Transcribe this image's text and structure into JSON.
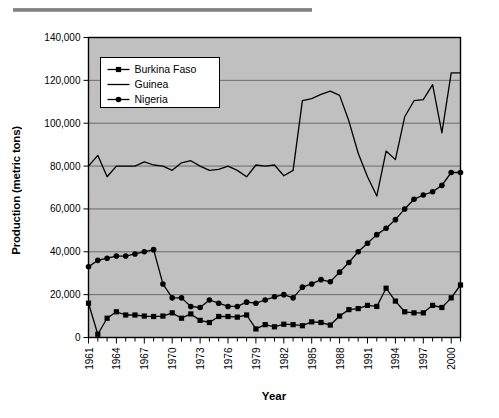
{
  "chart_data": {
    "type": "line",
    "title": "",
    "xlabel": "Year",
    "ylabel": "Production (metric tons)",
    "xlim": [
      1961,
      2001
    ],
    "ylim": [
      0,
      140000
    ],
    "ytick_values": [
      0,
      20000,
      40000,
      60000,
      80000,
      100000,
      120000,
      140000
    ],
    "ytick_labels": [
      "0",
      "20,000",
      "40,000",
      "60,000",
      "80,000",
      "100,000",
      "120,000",
      "140,000"
    ],
    "x": [
      1961,
      1962,
      1963,
      1964,
      1965,
      1966,
      1967,
      1968,
      1969,
      1970,
      1971,
      1972,
      1973,
      1974,
      1975,
      1976,
      1977,
      1978,
      1979,
      1980,
      1981,
      1982,
      1983,
      1984,
      1985,
      1986,
      1987,
      1988,
      1989,
      1990,
      1991,
      1992,
      1993,
      1994,
      1995,
      1996,
      1997,
      1998,
      1999,
      2000,
      2001
    ],
    "xtick_labels": [
      "1961",
      "1964",
      "1967",
      "1970",
      "1973",
      "1976",
      "1979",
      "1982",
      "1985",
      "1988",
      "1991",
      "1994",
      "1997",
      "2000"
    ],
    "xtick_values": [
      1961,
      1964,
      1967,
      1970,
      1973,
      1976,
      1979,
      1982,
      1985,
      1988,
      1991,
      1994,
      1997,
      2000
    ],
    "grid": "horizontal",
    "legend_position": "upper-left",
    "plot_background": "#c0c0c0",
    "series": [
      {
        "name": "Burkina Faso",
        "marker": "square",
        "color": "#000000",
        "values": [
          16000,
          1500,
          9000,
          12000,
          10500,
          10500,
          10000,
          9800,
          10000,
          11500,
          9000,
          11000,
          8000,
          7000,
          9800,
          9800,
          9500,
          10500,
          4000,
          6000,
          5000,
          6200,
          6000,
          5500,
          7300,
          7000,
          5800,
          10000,
          13000,
          13500,
          15000,
          14500,
          23000,
          17000,
          12000,
          11500,
          11500,
          15000,
          14000,
          18500,
          24500
        ]
      },
      {
        "name": "Guinea",
        "marker": "none",
        "color": "#000000",
        "values": [
          80000,
          85000,
          75000,
          80000,
          80000,
          80000,
          82000,
          80500,
          80000,
          78000,
          81500,
          82500,
          80000,
          78000,
          78500,
          80000,
          78000,
          75000,
          80500,
          80000,
          80500,
          75500,
          78000,
          110500,
          111500,
          113500,
          115000,
          113000,
          101000,
          86000,
          75000,
          66000,
          87000,
          83000,
          103000,
          110500,
          111000,
          118000,
          95500,
          123500,
          123500
        ]
      },
      {
        "name": "Nigeria",
        "marker": "circle",
        "color": "#000000",
        "values": [
          33000,
          36000,
          37000,
          38000,
          38000,
          39000,
          40000,
          41000,
          25000,
          18500,
          18500,
          14500,
          14000,
          17500,
          16000,
          14500,
          14500,
          16500,
          16000,
          17500,
          19000,
          20000,
          18500,
          23500,
          25000,
          27000,
          26000,
          30500,
          35000,
          40000,
          44000,
          48000,
          51000,
          55000,
          60000,
          64500,
          66500,
          68000,
          71000,
          77000,
          77000
        ]
      }
    ]
  },
  "legend": {
    "entries": [
      {
        "label": "Burkina Faso",
        "marker": "square"
      },
      {
        "label": "Guinea",
        "marker": "none"
      },
      {
        "label": "Nigeria",
        "marker": "circle"
      }
    ]
  }
}
